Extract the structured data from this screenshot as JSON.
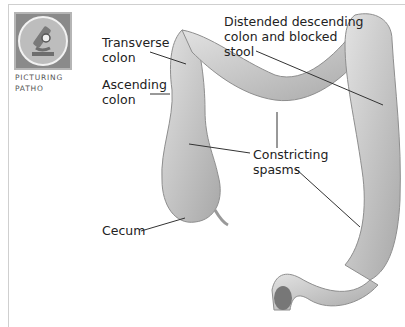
{
  "badge": {
    "icon": "microscope-icon",
    "caption_line1": "PICTURING",
    "caption_line2": "PATHO"
  },
  "labels": {
    "transverse": [
      "Transverse",
      "colon"
    ],
    "ascending": [
      "Ascending",
      "colon"
    ],
    "cecum": "Cecum",
    "distended": [
      "Distended descending",
      "colon and blocked",
      "stool"
    ],
    "constricting": [
      "Constricting",
      "spasms"
    ]
  },
  "colors": {
    "colon_fill": "#c9c9c9",
    "colon_shadow": "#9a9a9a",
    "leader_line": "#333333",
    "text": "#222222"
  }
}
